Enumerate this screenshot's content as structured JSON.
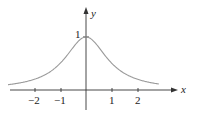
{
  "chart_data": {
    "type": "line",
    "title": "",
    "function": "y = 1/(1+x^2)",
    "xlabel": "x",
    "ylabel": "y",
    "x_ticks": [
      -2,
      -1,
      1,
      2
    ],
    "x_tick_labels": [
      "−2",
      "−1",
      "1",
      "2"
    ],
    "y_ticks": [
      1
    ],
    "y_tick_labels": [
      "1"
    ],
    "xlim": [
      -3.0,
      2.8
    ],
    "ylim": [
      0,
      1
    ],
    "grid": false,
    "legend": null,
    "series": [
      {
        "name": "curve",
        "color": "#9a9a9a",
        "x": [
          -2.8,
          -2,
          -1,
          0,
          1,
          2,
          2.8
        ],
        "y": [
          0.113,
          0.2,
          0.5,
          1,
          0.5,
          0.2,
          0.113
        ]
      }
    ]
  },
  "labels": {
    "x_axis": "x",
    "y_axis": "y",
    "y_one": "1",
    "xt": [
      "−2",
      "−1",
      "1",
      "2"
    ]
  }
}
